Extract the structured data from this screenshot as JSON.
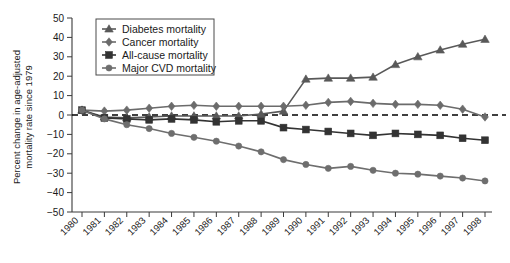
{
  "chart_data": {
    "type": "line",
    "title": "",
    "xlabel": "",
    "ylabel": "Percent change in age-adjusted mortality rate since 1979",
    "xlim": [
      1980,
      1998
    ],
    "ylim": [
      -50,
      50
    ],
    "ytick_labels": [
      "50",
      "40",
      "30",
      "20",
      "10",
      "0",
      "-10",
      "-20",
      "-30",
      "-40",
      "-50"
    ],
    "ytick_values": [
      50,
      40,
      30,
      20,
      10,
      0,
      -10,
      -20,
      -30,
      -40,
      -50
    ],
    "x": [
      1980,
      1981,
      1982,
      1983,
      1984,
      1985,
      1986,
      1987,
      1988,
      1989,
      1990,
      1991,
      1992,
      1993,
      1994,
      1995,
      1996,
      1997,
      1998
    ],
    "xtick_labels": [
      "1980",
      "1981",
      "1982",
      "1983",
      "1984",
      "1985",
      "1986",
      "1987",
      "1988",
      "1989",
      "1990",
      "1991",
      "1992",
      "1993",
      "1994",
      "1995",
      "1996",
      "1997",
      "1998"
    ],
    "grid": false,
    "zero_reference_line": 0,
    "legend_position": "upper-left",
    "series": [
      {
        "name": "Diabetes mortality",
        "marker": "triangle",
        "color": "#595959",
        "values": [
          2.5,
          -1.0,
          -1.5,
          -1.0,
          -0.5,
          -0.5,
          -0.5,
          -0.5,
          0.5,
          2.0,
          18.5,
          19.0,
          19.0,
          19.5,
          26.0,
          30.0,
          33.5,
          36.5,
          39.0
        ]
      },
      {
        "name": "Cancer mortality",
        "marker": "diamond",
        "color": "#6b6b6b",
        "values": [
          2.5,
          2.0,
          2.5,
          3.5,
          4.5,
          5.0,
          4.5,
          4.5,
          4.5,
          4.5,
          5.0,
          6.5,
          7.0,
          6.0,
          5.5,
          5.5,
          5.0,
          3.0,
          -1.0
        ]
      },
      {
        "name": "All-cause mortality",
        "marker": "square",
        "color": "#333333",
        "values": [
          2.5,
          -1.5,
          -2.0,
          -2.5,
          -2.0,
          -2.5,
          -3.5,
          -3.0,
          -3.0,
          -6.5,
          -7.5,
          -8.5,
          -9.5,
          -10.5,
          -9.5,
          -10.0,
          -10.5,
          -12.0,
          -13.0
        ]
      },
      {
        "name": "Major CVD mortality",
        "marker": "circle",
        "color": "#6e6e6e",
        "values": [
          2.5,
          -2.0,
          -5.0,
          -7.0,
          -9.5,
          -11.5,
          -13.5,
          -16.0,
          -19.0,
          -23.0,
          -25.5,
          -27.5,
          -26.5,
          -28.5,
          -30.0,
          -30.5,
          -31.5,
          -32.5,
          -34.0
        ]
      }
    ]
  },
  "legend": {
    "items": [
      {
        "label": "Diabetes mortality"
      },
      {
        "label": "Cancer mortality"
      },
      {
        "label": "All-cause mortality"
      },
      {
        "label": "Major CVD mortality"
      }
    ]
  }
}
